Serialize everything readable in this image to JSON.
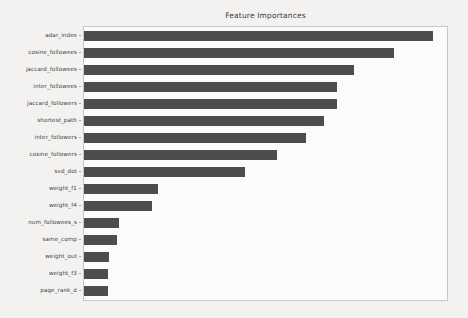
{
  "chart_data": {
    "type": "bar",
    "orientation": "horizontal",
    "title": "Feature Importances",
    "xlabel": "",
    "ylabel": "",
    "grid": false,
    "legend": false,
    "xlim": [
      0,
      0.115
    ],
    "xticks": [],
    "xticklabels": [],
    "bar_color": "#4d4d4d",
    "categories": [
      "adar_index",
      "cosine_followees",
      "jaccard_followees",
      "inter_followees",
      "jaccard_followers",
      "shortest_path",
      "inter_followers",
      "cosine_followers",
      "svd_dot",
      "weight_f1",
      "weight_f4",
      "num_followees_s",
      "same_comp",
      "weight_out",
      "weight_f3",
      "page_rank_d"
    ],
    "values": [
      0.1105,
      0.0982,
      0.0856,
      0.0801,
      0.0801,
      0.0761,
      0.0704,
      0.0613,
      0.0509,
      0.0236,
      0.0217,
      0.011,
      0.0104,
      0.0079,
      0.0076,
      0.0076
    ]
  },
  "figure": {
    "background_color": "#f3f2f1",
    "plot_background_color": "#fbfbfb",
    "plot_border_color": "#c9c7c6"
  }
}
